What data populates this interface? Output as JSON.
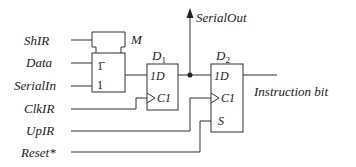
{
  "diagram": {
    "type": "logic-circuit",
    "inputs": [
      {
        "id": "shir",
        "label": "ShIR"
      },
      {
        "id": "data",
        "label": "Data"
      },
      {
        "id": "serialin",
        "label": "SerialIn"
      },
      {
        "id": "clkir",
        "label": "ClkIR"
      },
      {
        "id": "upir",
        "label": "UpIR"
      },
      {
        "id": "reset",
        "label": "Reset*"
      }
    ],
    "outputs": [
      {
        "id": "serialout",
        "label": "SerialOut"
      },
      {
        "id": "instruction",
        "label": "Instruction bit"
      }
    ],
    "mux": {
      "control_label": "M",
      "input0_label": "1̄",
      "input1_label": "1"
    },
    "flipflops": [
      {
        "id": "d1",
        "name": "D",
        "subscript": "1",
        "d_pin": "1D",
        "clk_pin": "C1"
      },
      {
        "id": "d2",
        "name": "D",
        "subscript": "2",
        "d_pin": "1D",
        "clk_pin": "C1",
        "set_pin": "S"
      }
    ]
  }
}
